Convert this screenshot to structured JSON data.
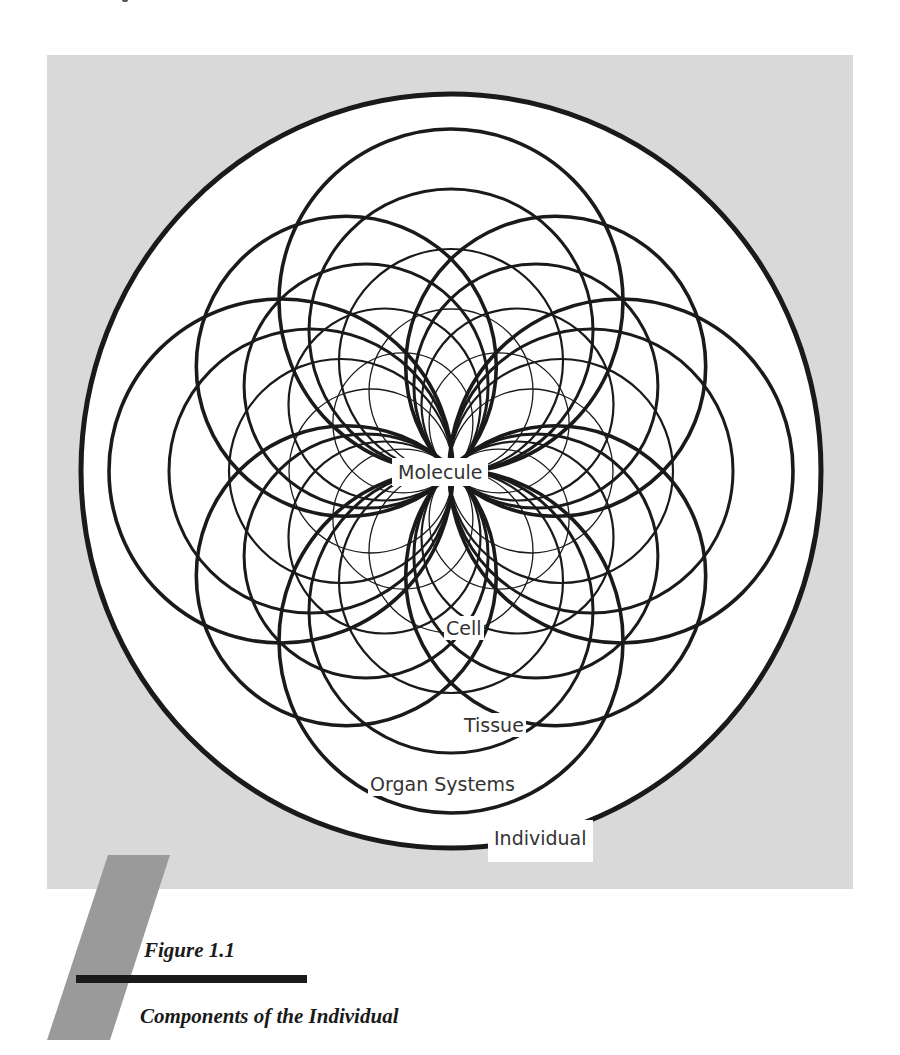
{
  "figure": {
    "number_label": "Figure 1.1",
    "title": "Components of the Individual",
    "colors": {
      "panel_background": "#d9d9d9",
      "circle_fill": "#ffffff",
      "line": "#1a1a1a",
      "label_text": "#333333",
      "slant_bar": "#9a9a9a",
      "caption_rule": "#1a1a1a"
    }
  },
  "labels": {
    "molecule": "Molecule",
    "cell": "Cell",
    "tissue": "Tissue",
    "organ_systems": "Organ Systems",
    "individual": "Individual"
  },
  "diagram": {
    "center": [
      451,
      471
    ],
    "individual": {
      "rx": 370,
      "ry": 377,
      "stroke": 5
    },
    "families": [
      {
        "name": "organ-systems",
        "axis_radius": 172,
        "diag_radius": 150,
        "stroke": 3.6
      },
      {
        "name": "tissue",
        "axis_radius": 142,
        "diag_radius": 122,
        "stroke": 3.0
      },
      {
        "name": "cell",
        "axis_radius": 112,
        "diag_radius": 96,
        "stroke": 2.2
      },
      {
        "name": "molecule",
        "axis_radius": 82,
        "diag_radius": 70,
        "stroke": 1.3
      }
    ]
  }
}
